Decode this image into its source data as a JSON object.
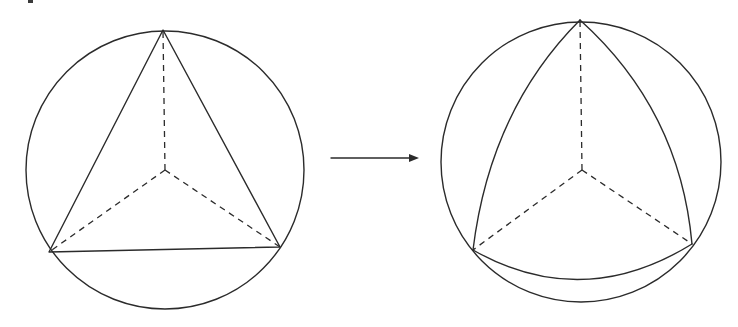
{
  "diagram": {
    "title": "",
    "stroke_color": "#2b2b2b",
    "background": "#ffffff",
    "left_figure": {
      "label": "planar-triangle-in-circle",
      "circle": {
        "cx": 165,
        "cy": 170,
        "r": 139
      },
      "center": {
        "x": 165,
        "y": 170
      },
      "vertices": [
        {
          "x": 163,
          "y": 30
        },
        {
          "x": 49,
          "y": 252
        },
        {
          "x": 280,
          "y": 247
        }
      ],
      "edge_style": "straight",
      "radial_style": "dashed"
    },
    "arrow": {
      "label": "transform-arrow",
      "from": {
        "x": 331,
        "y": 158
      },
      "to": {
        "x": 418,
        "y": 158
      }
    },
    "right_figure": {
      "label": "spherical-triangle-on-sphere",
      "circle": {
        "cx": 581,
        "cy": 162,
        "r": 140
      },
      "center": {
        "x": 582,
        "y": 170
      },
      "vertices": [
        {
          "x": 580,
          "y": 20
        },
        {
          "x": 473,
          "y": 250
        },
        {
          "x": 692,
          "y": 244
        }
      ],
      "edge_style": "curved-outward",
      "radial_style": "dashed"
    }
  }
}
